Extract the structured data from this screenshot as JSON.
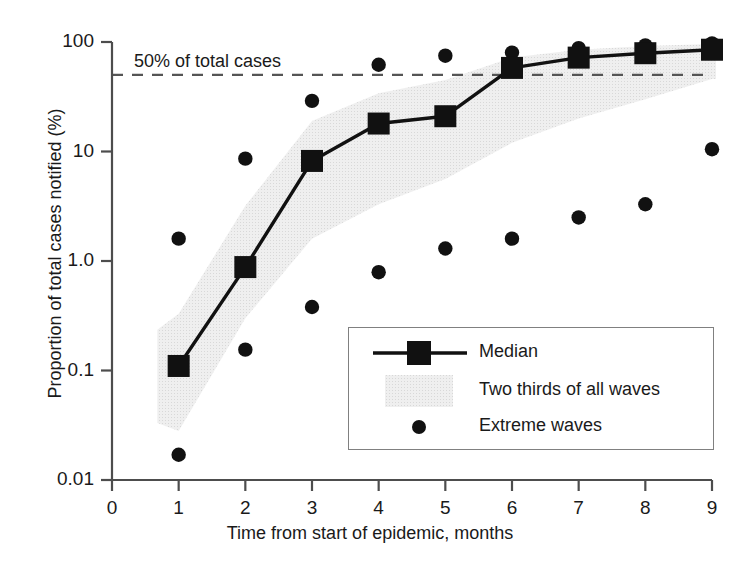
{
  "chart_data": {
    "type": "line",
    "title": "",
    "xlabel": "Time from start of epidemic, months",
    "ylabel": "Proportion of total cases notified (%)",
    "xlim": [
      0,
      9
    ],
    "ylim": [
      0.01,
      100
    ],
    "yscale": "log",
    "grid": false,
    "legend_position": "lower-right-inside",
    "x": [
      1,
      2,
      3,
      4,
      5,
      6,
      7,
      8,
      9
    ],
    "xticks": [
      "0",
      "1",
      "2",
      "3",
      "4",
      "5",
      "6",
      "7",
      "8",
      "9"
    ],
    "xtick_values": [
      0,
      1,
      2,
      3,
      4,
      5,
      6,
      7,
      8,
      9
    ],
    "yticks": [
      "0.01",
      "0.1",
      "1.0",
      "10",
      "100"
    ],
    "ytick_values": [
      0.01,
      0.1,
      1.0,
      10,
      100
    ],
    "series": [
      {
        "name": "Median",
        "marker": "square",
        "values": [
          0.11,
          0.88,
          8.2,
          18.0,
          21.0,
          58.0,
          72.0,
          79.0,
          85.0
        ]
      }
    ],
    "band": {
      "name": "Two thirds of all waves",
      "upper": [
        0.33,
        3.2,
        19.0,
        34.0,
        45.0,
        72.0,
        85.0,
        92.0,
        96.0
      ],
      "lower": [
        0.028,
        0.3,
        1.6,
        3.3,
        5.6,
        12.0,
        20.0,
        30.0,
        46.0
      ]
    },
    "extreme_waves": {
      "name": "Extreme waves",
      "marker": "circle",
      "points": [
        {
          "x": 1,
          "y": 1.6
        },
        {
          "x": 1,
          "y": 0.017
        },
        {
          "x": 2,
          "y": 8.6
        },
        {
          "x": 2,
          "y": 0.155
        },
        {
          "x": 3,
          "y": 29.0
        },
        {
          "x": 3,
          "y": 0.38
        },
        {
          "x": 4,
          "y": 62.0
        },
        {
          "x": 4,
          "y": 0.79
        },
        {
          "x": 5,
          "y": 75.0
        },
        {
          "x": 5,
          "y": 1.3
        },
        {
          "x": 6,
          "y": 80.0
        },
        {
          "x": 6,
          "y": 1.6
        },
        {
          "x": 7,
          "y": 88.0
        },
        {
          "x": 7,
          "y": 2.5
        },
        {
          "x": 8,
          "y": 93.0
        },
        {
          "x": 8,
          "y": 3.3
        },
        {
          "x": 9,
          "y": 97.0
        },
        {
          "x": 9,
          "y": 10.5
        }
      ]
    },
    "annotations": [
      {
        "name": "threshold-line",
        "text": "50% of total cases",
        "y": 50,
        "style": "dashed"
      }
    ]
  },
  "axes": {
    "x_title": "Time from start of epidemic, months",
    "y_title": "Proportion of total cases notified (%)",
    "x_ticks": [
      "0",
      "1",
      "2",
      "3",
      "4",
      "5",
      "6",
      "7",
      "8",
      "9"
    ],
    "y_ticks": [
      "100",
      "10",
      "1.0",
      "0.1",
      "0.01"
    ]
  },
  "annotation": {
    "threshold_text": "50% of total cases"
  },
  "legend": {
    "items": [
      {
        "label": "Median",
        "symbol": "line-square"
      },
      {
        "label": "Two thirds of all waves",
        "symbol": "shaded-band"
      },
      {
        "label": "Extreme waves",
        "symbol": "circle"
      }
    ]
  },
  "colors": {
    "ink": "#1a1a1a",
    "axis": "#4d4d4d",
    "band": "#e8e8e8",
    "dash": "#555555",
    "legend_border": "#808080"
  }
}
